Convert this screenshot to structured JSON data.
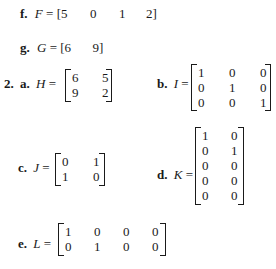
{
  "items": {
    "f": {
      "label": "f.",
      "var": "F",
      "eq": "=",
      "open": "[",
      "values": [
        "5",
        "0",
        "1",
        "2"
      ],
      "close": "]"
    },
    "g": {
      "label": "g.",
      "var": "G",
      "eq": "=",
      "open": "[",
      "values": [
        "6",
        "9"
      ],
      "close": "]"
    }
  },
  "problem2": {
    "number": "2.",
    "a": {
      "label": "a.",
      "var": "H",
      "eq": "=",
      "rows": [
        [
          "6",
          "5"
        ],
        [
          "9",
          "2"
        ]
      ]
    },
    "b": {
      "label": "b.",
      "var": "I",
      "eq": "=",
      "rows": [
        [
          "1",
          "0",
          "0"
        ],
        [
          "0",
          "1",
          "0"
        ],
        [
          "0",
          "0",
          "1"
        ]
      ]
    },
    "c": {
      "label": "c.",
      "var": "J",
      "eq": "=",
      "rows": [
        [
          "0",
          "1"
        ],
        [
          "1",
          "0"
        ]
      ]
    },
    "d": {
      "label": "d.",
      "var": "K",
      "eq": "=",
      "rows": [
        [
          "1",
          "0"
        ],
        [
          "0",
          "1"
        ],
        [
          "0",
          "0"
        ],
        [
          "0",
          "0"
        ],
        [
          "0",
          "0"
        ]
      ]
    },
    "e": {
      "label": "e.",
      "var": "L",
      "eq": "=",
      "rows": [
        [
          "1",
          "0",
          "0",
          "0"
        ],
        [
          "0",
          "1",
          "0",
          "0"
        ]
      ]
    }
  }
}
